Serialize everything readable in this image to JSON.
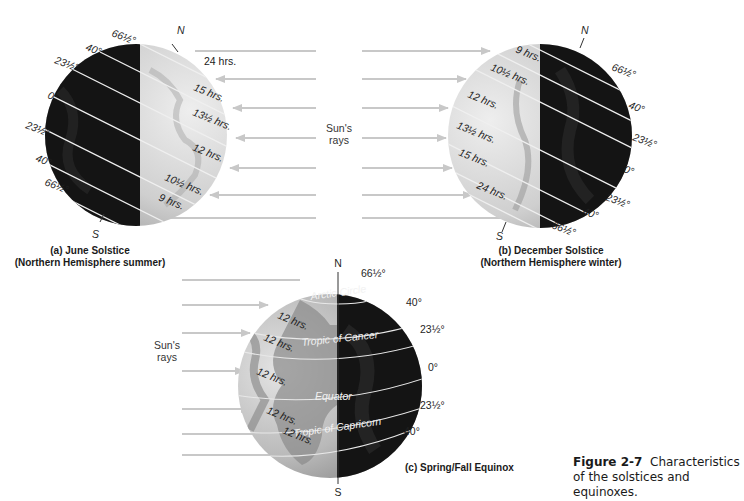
{
  "figure": {
    "number": "Figure 2-7",
    "caption_line1": "Characteristics",
    "caption_line2": "of the solstices and equinoxes.",
    "colors": {
      "ray_arrow": "#c8c8c8",
      "night_side": "#141414",
      "day_side": "#d6d6d6",
      "latitude_line": "#f0f0f0",
      "text": "#1a1a1a"
    }
  },
  "sun_rays_label": {
    "line1": "Sun's",
    "line2": "rays"
  },
  "panels": [
    {
      "id": "a",
      "title": "(a) June Solstice",
      "subtitle": "(Northern Hemisphere summer)",
      "north": "N",
      "south": "S",
      "latitudes": [
        "66½°",
        "40°",
        "23½°",
        "0°",
        "23½°",
        "40°",
        "66½°"
      ],
      "day_lengths": [
        "24 hrs.",
        "15 hrs.",
        "13½ hrs.",
        "12 hrs.",
        "10½ hrs.",
        "9 hrs."
      ]
    },
    {
      "id": "b",
      "title": "(b) December Solstice",
      "subtitle": "(Northern Hemisphere winter)",
      "north": "N",
      "south": "S",
      "latitudes": [
        "66½°",
        "40°",
        "23½°",
        "0°",
        "23½°",
        "40°",
        "66½°"
      ],
      "day_lengths": [
        "9 hrs.",
        "10½ hrs.",
        "12 hrs.",
        "13½ hrs.",
        "15 hrs.",
        "24 hrs."
      ]
    },
    {
      "id": "c",
      "title": "(c) Spring/Fall Equinox",
      "north": "N",
      "south": "S",
      "latitudes": [
        "66½°",
        "40°",
        "23½°",
        "0°",
        "23½°",
        "40°"
      ],
      "day_lengths": [
        "12 hrs.",
        "12 hrs.",
        "12 hrs.",
        "12 hrs.",
        "12 hrs."
      ],
      "circle_names": [
        "Arctic Circle",
        "Tropic of Cancer",
        "Equator",
        "Tropic of Capricorn"
      ]
    }
  ]
}
